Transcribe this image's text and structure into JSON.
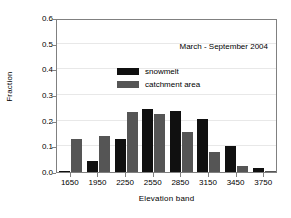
{
  "chart_data": {
    "type": "bar",
    "title": "",
    "annotation": "March - September 2004",
    "xlabel": "Elevation band",
    "ylabel": "Fraction",
    "categories": [
      "1650",
      "1950",
      "2250",
      "2550",
      "2850",
      "3150",
      "3450",
      "3750"
    ],
    "series": [
      {
        "name": "snowmelt",
        "color": "#101010",
        "values": [
          0.005,
          0.042,
          0.13,
          0.245,
          0.237,
          0.205,
          0.1,
          0.015
        ]
      },
      {
        "name": "catchment area",
        "color": "#555555",
        "values": [
          0.128,
          0.139,
          0.232,
          0.226,
          0.157,
          0.078,
          0.022,
          0.002
        ]
      }
    ],
    "ylim": [
      0.0,
      0.6
    ],
    "ytick_values": [
      "0.0",
      "0.1",
      "0.2",
      "0.3",
      "0.4",
      "0.5",
      "0.6"
    ],
    "ytick_numbers": [
      0.0,
      0.1,
      0.2,
      0.3,
      0.4,
      0.5,
      0.6
    ],
    "grid": true,
    "grid_axis": "y",
    "legend_position": "upper-left",
    "frame_color": "#808080"
  }
}
